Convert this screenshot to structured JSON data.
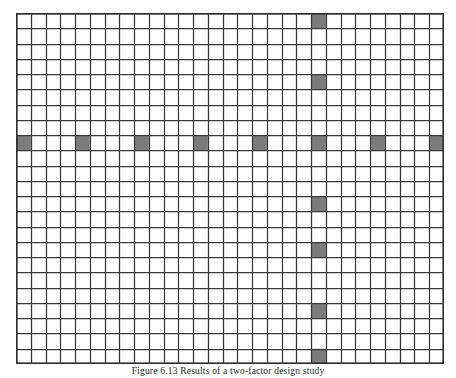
{
  "figure": {
    "caption": "Figure 6.13  Results of a two-factor design study",
    "alt_label": "shaded-grid-matrix"
  },
  "colors": {
    "grid_line": "#3a3a3a",
    "grid_line_minor": "#555555",
    "shaded_cell": "#7c7c7c",
    "background": "#ffffff",
    "border": "#2e2e2e"
  },
  "chart_data": {
    "type": "heatmap",
    "title": "",
    "subtitle": "",
    "xlabel": "",
    "ylabel": "",
    "columns": 29,
    "rows": 23,
    "cell_width": 14.76,
    "cell_height": 15.26,
    "grid": true,
    "legend": "none",
    "xlim": [
      0,
      29
    ],
    "ylim": [
      0,
      23
    ],
    "xticklabels": [],
    "yticklabels": [],
    "value_scale": {
      "unshaded": 0,
      "shaded": 1
    },
    "shaded_cells": [
      {
        "col": 20,
        "row": 0
      },
      {
        "col": 20,
        "row": 4
      },
      {
        "col": 0,
        "row": 8
      },
      {
        "col": 4,
        "row": 8
      },
      {
        "col": 8,
        "row": 8
      },
      {
        "col": 12,
        "row": 8
      },
      {
        "col": 16,
        "row": 8
      },
      {
        "col": 20,
        "row": 8
      },
      {
        "col": 24,
        "row": 8
      },
      {
        "col": 28,
        "row": 8
      },
      {
        "col": 20,
        "row": 12
      },
      {
        "col": 20,
        "row": 15
      },
      {
        "col": 20,
        "row": 19
      },
      {
        "col": 20,
        "row": 22
      }
    ],
    "series": [
      {
        "name": "row-8-horizontal-band",
        "orientation": "horizontal",
        "row": 8,
        "cols": [
          0,
          4,
          8,
          12,
          16,
          20,
          24,
          28
        ],
        "count": 8
      },
      {
        "name": "col-20-vertical-band",
        "orientation": "vertical",
        "col": 20,
        "rows": [
          0,
          4,
          8,
          12,
          15,
          19,
          22
        ],
        "count": 7
      }
    ],
    "annotations": []
  }
}
